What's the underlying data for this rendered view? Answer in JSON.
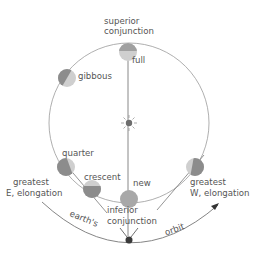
{
  "diagram": {
    "type": "inferior-planet-orbit-phases",
    "colors": {
      "planet_light": "#cfcfcf",
      "planet_dark": "#8c8c8c",
      "orbit_line": "#9a9a9a",
      "sight_line": "#7a7a7a",
      "earth": "#3a3a3a",
      "sun": "#6e6e6e",
      "text": "#555555"
    },
    "labels": {
      "superior_line1": "superior",
      "superior_line2": "conjunction",
      "full": "full",
      "gibbous": "gibbous",
      "quarter": "quarter",
      "crescent": "crescent",
      "new": "new",
      "e_elong_line1": "greatest",
      "e_elong_line2": "E, elongation",
      "w_elong_line1": "greatest",
      "w_elong_line2": "W, elongation",
      "inferior_line1": "inferior",
      "inferior_line2": "conjunction",
      "earths": "earth's",
      "orbit": "orbit"
    },
    "icons": {
      "sun": "sun-icon",
      "earth": "earth-dot-icon"
    }
  }
}
